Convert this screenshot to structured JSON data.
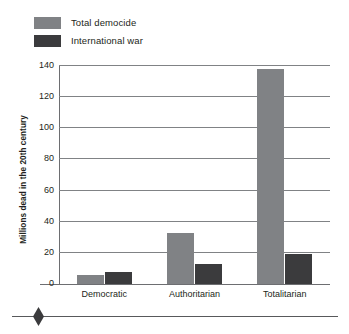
{
  "chart_data": {
    "type": "bar",
    "title": "",
    "xlabel": "",
    "ylabel": "Millions dead in the 20th century",
    "ylim": [
      0,
      140
    ],
    "ytick_step": 20,
    "yticks": [
      "0",
      "20",
      "40",
      "60",
      "80",
      "100",
      "120",
      "140"
    ],
    "grid": true,
    "legend_position": "top-left",
    "categories": [
      "Democratic",
      "Authoritarian",
      "Totalitarian"
    ],
    "series": [
      {
        "name": "Total democide",
        "color": "#808285",
        "values": [
          6,
          33,
          138
        ]
      },
      {
        "name": "International war",
        "color": "#3b3b3d",
        "values": [
          8,
          13,
          19
        ]
      }
    ]
  },
  "legend": {
    "items": [
      {
        "label": "Total democide",
        "swatch": "#808285"
      },
      {
        "label": "International war",
        "swatch": "#3b3b3d"
      }
    ]
  },
  "footer": {
    "ornament": "diamond-ornament"
  }
}
